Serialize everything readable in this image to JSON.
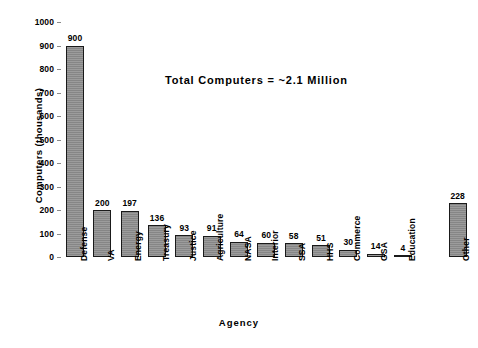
{
  "chart_data": {
    "type": "bar",
    "title": "",
    "annotation": "Total  Computers  =  ~2.1  Million",
    "xlabel": "Agency",
    "ylabel": "Computers  (thousands)",
    "ylim": [
      0,
      1000
    ],
    "ytick_step": 100,
    "yticks": [
      0,
      100,
      200,
      300,
      400,
      500,
      600,
      700,
      800,
      900,
      1000
    ],
    "ytick_labels": [
      "0",
      "100",
      "200",
      "300",
      "400",
      "500",
      "600",
      "700",
      "800",
      "900",
      "1000"
    ],
    "grid": false,
    "legend": false,
    "bar_color": "#8d8d8d",
    "bar_edge_color": "#1a1a1a",
    "categories": [
      "Defense",
      "VA",
      "Energy",
      "Treasury",
      "Justice",
      "Agriculture",
      "NASA",
      "Interior",
      "SSA",
      "HHS",
      "Commerce",
      "GSA",
      "Education",
      "Other"
    ],
    "values": [
      900,
      200,
      197,
      136,
      93,
      91,
      64,
      60,
      58,
      51,
      30,
      14,
      4,
      228
    ],
    "value_labels": [
      "900",
      "200",
      "197",
      "136",
      "93",
      "91",
      "64",
      "60",
      "58",
      "51",
      "30",
      "14",
      "4",
      "228"
    ],
    "bar_slots": 15,
    "gap_slot_index": 13
  }
}
